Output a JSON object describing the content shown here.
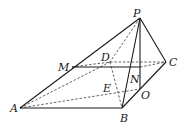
{
  "figure": {
    "type": "pyramid",
    "labels": {
      "P": "P",
      "A": "A",
      "B": "B",
      "C": "C",
      "D": "D",
      "M": "M",
      "N": "N",
      "E": "E",
      "O": "O"
    },
    "points": {
      "P": [
        140,
        18
      ],
      "A": [
        20,
        108
      ],
      "B": [
        122,
        108
      ],
      "C": [
        166,
        62
      ],
      "D": [
        110,
        62
      ],
      "M": [
        72,
        67
      ],
      "O": [
        140,
        89
      ],
      "K": [
        140,
        67
      ]
    },
    "solid_edges": [
      [
        "A",
        "P"
      ],
      [
        "A",
        "B"
      ],
      [
        "P",
        "B"
      ],
      [
        "P",
        "C"
      ],
      [
        "B",
        "C"
      ],
      [
        "P",
        "O"
      ],
      [
        "M",
        "K"
      ]
    ],
    "dashed_edges": [
      [
        "A",
        "D"
      ],
      [
        "P",
        "D"
      ],
      [
        "D",
        "C"
      ],
      [
        "M",
        "D"
      ],
      [
        "D",
        "B"
      ],
      [
        "A",
        "O"
      ],
      [
        "M",
        "C"
      ]
    ]
  }
}
